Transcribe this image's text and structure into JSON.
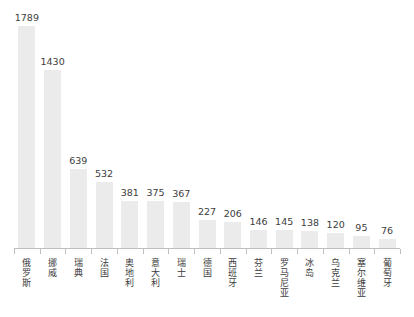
{
  "chart_data": {
    "type": "bar",
    "title": "",
    "subtitle": "",
    "xlabel": "",
    "ylabel": "",
    "ylim": [
      0,
      1900
    ],
    "grid": false,
    "legend": null,
    "orientation": "vertical",
    "value_labels_shown": true,
    "categories": [
      "俄罗斯",
      "挪威",
      "瑞典",
      "法国",
      "奥地利",
      "意大利",
      "瑞士",
      "德国",
      "西班牙",
      "芬兰",
      "罗马尼亚",
      "冰岛",
      "乌克兰",
      "塞尔维亚",
      "葡萄牙"
    ],
    "values": [
      1789,
      1430,
      639,
      532,
      381,
      375,
      367,
      227,
      206,
      146,
      145,
      138,
      120,
      95,
      76
    ]
  },
  "style": {
    "bar_color": "#ebebeb",
    "background_color": "#ffffff",
    "text_color": "#3d3d3d",
    "axis_color": "#bfbfbf"
  }
}
